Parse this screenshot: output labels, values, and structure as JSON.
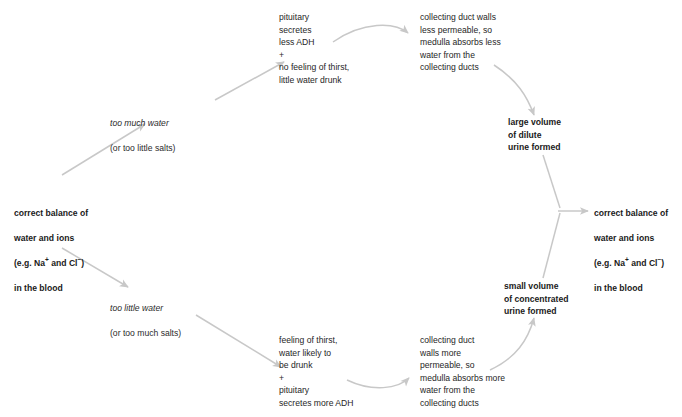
{
  "diagram": {
    "arrow_color": "#c8c8c8",
    "text_color": "#1a1a1a",
    "nodes": {
      "start_balance": {
        "line1": "correct balance of",
        "line2": "water and ions",
        "line3_pre": "(e.g. Na",
        "line3_sup1": "+",
        "line3_mid": " and Cl",
        "line3_sup2": "−",
        "line3_post": ")",
        "line4": "in the blood"
      },
      "end_balance": {
        "line1": "correct balance of",
        "line2": "water and ions",
        "line3_pre": "(e.g. Na",
        "line3_sup1": "+",
        "line3_mid": " and Cl",
        "line3_sup2": "−",
        "line3_post": ")",
        "line4": "in the blood"
      },
      "too_much_water": {
        "italic_part": "too much water",
        "plain_part": "(or too little salts)"
      },
      "too_little_water": {
        "italic_part": "too little water",
        "plain_part": "(or too much salts)"
      },
      "pituitary_less_adh": "pituitary\nsecretes\nless ADH\n+\nno feeling of thirst,\nlittle water drunk",
      "duct_less_permeable": "collecting duct walls\nless permeable, so\nmedulla absorbs less\nwater from the\ncollecting ducts",
      "large_volume": "large volume\nof dilute\nurine formed",
      "thirst_more_adh": "feeling of thirst,\nwater likely to\nbe drunk\n+\npituitary\nsecretes more ADH",
      "duct_more_permeable": "collecting duct\nwalls more\npermeable, so\nmedulla absorbs more\nwater from the\ncollecting ducts",
      "small_volume": "small volume\nof concentrated\nurine formed"
    }
  }
}
